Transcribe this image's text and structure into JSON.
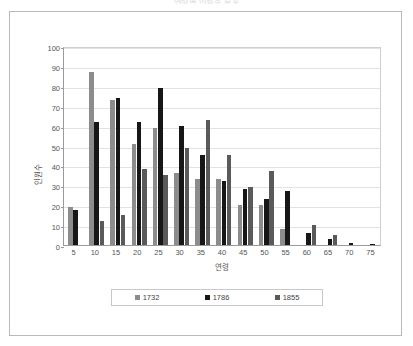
{
  "figure": {
    "title": "연령별 인원수 분포",
    "y_axis_title": "인원수",
    "x_axis_title": "연령"
  },
  "chart_data": {
    "type": "bar",
    "title": "연령별 인원수 분포",
    "xlabel": "연령",
    "ylabel": "인원수",
    "ylim": [
      0,
      100
    ],
    "ytick_step": 10,
    "grid": true,
    "legend_position": "bottom",
    "categories": [
      "5",
      "10",
      "15",
      "20",
      "25",
      "30",
      "35",
      "40",
      "45",
      "50",
      "55",
      "60",
      "65",
      "70",
      "75"
    ],
    "series": [
      {
        "name": "1732",
        "color": "#8c8c8c",
        "values": [
          19,
          87,
          73,
          51,
          59,
          36,
          33,
          33,
          20,
          20,
          8,
          0,
          0,
          0,
          0
        ]
      },
      {
        "name": "1786",
        "color": "#171717",
        "values": [
          17.5,
          62,
          74,
          62,
          79,
          60,
          45,
          32,
          28,
          23,
          27,
          6,
          3,
          1,
          0.6
        ]
      },
      {
        "name": "1855",
        "color": "#5a5a5a",
        "values": [
          0,
          12,
          15,
          38,
          35,
          49,
          63,
          45,
          29,
          37,
          0,
          10,
          5,
          0,
          0
        ]
      }
    ],
    "yticks": [
      "0",
      "10",
      "20",
      "30",
      "40",
      "50",
      "60",
      "70",
      "80",
      "90",
      "100"
    ]
  },
  "legend": {
    "items": [
      {
        "label": "1732",
        "color": "#8c8c8c"
      },
      {
        "label": "1786",
        "color": "#171717"
      },
      {
        "label": "1855",
        "color": "#5a5a5a"
      }
    ]
  }
}
